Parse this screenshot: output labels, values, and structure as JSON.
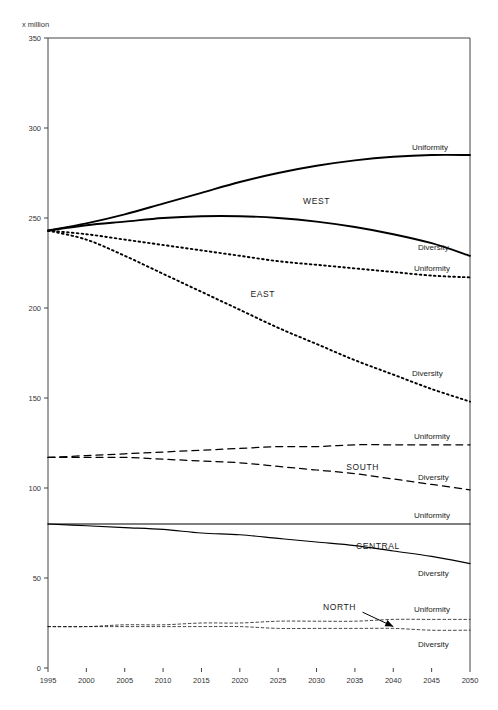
{
  "chart_data": {
    "type": "line",
    "title": "",
    "ylabel": "x million",
    "xlabel": "",
    "xlim": [
      1995,
      2050
    ],
    "ylim": [
      0,
      350
    ],
    "xticks": [
      1995,
      2000,
      2005,
      2010,
      2015,
      2020,
      2025,
      2030,
      2035,
      2040,
      2045,
      2050
    ],
    "yticks": [
      0,
      50,
      100,
      150,
      200,
      250,
      300,
      350
    ],
    "grid": false,
    "legend_position": "inline-end-of-line",
    "x": [
      1995,
      2000,
      2005,
      2010,
      2015,
      2020,
      2025,
      2030,
      2035,
      2040,
      2045,
      2050
    ],
    "series": [
      {
        "name": "WEST Uniformity",
        "region": "WEST",
        "scenario": "Uniformity",
        "style": "solid-thick",
        "values": [
          243,
          247,
          252,
          258,
          264,
          270,
          275,
          279,
          282,
          284,
          285,
          285
        ]
      },
      {
        "name": "WEST Diversity",
        "region": "WEST",
        "scenario": "Diversity",
        "style": "solid-thick",
        "values": [
          243,
          246,
          248,
          250,
          251,
          251,
          250,
          248,
          245,
          241,
          236,
          229
        ]
      },
      {
        "name": "EAST Uniformity",
        "region": "EAST",
        "scenario": "Uniformity",
        "style": "dotted",
        "values": [
          243,
          241,
          238,
          235,
          232,
          229,
          226,
          224,
          222,
          220,
          218,
          217
        ]
      },
      {
        "name": "EAST Diversity",
        "region": "EAST",
        "scenario": "Diversity",
        "style": "dotted",
        "values": [
          243,
          238,
          229,
          219,
          209,
          199,
          189,
          180,
          171,
          163,
          155,
          148
        ]
      },
      {
        "name": "SOUTH Uniformity",
        "region": "SOUTH",
        "scenario": "Uniformity",
        "style": "dashed",
        "values": [
          117,
          118,
          119,
          120,
          121,
          122,
          123,
          123,
          124,
          124,
          124,
          124
        ]
      },
      {
        "name": "SOUTH Diversity",
        "region": "SOUTH",
        "scenario": "Diversity",
        "style": "dashed",
        "values": [
          117,
          117,
          117,
          116,
          115,
          114,
          112,
          110,
          108,
          105,
          102,
          99
        ]
      },
      {
        "name": "CENTRAL Uniformity",
        "region": "CENTRAL",
        "scenario": "Uniformity",
        "style": "solid-thin",
        "values": [
          80,
          80,
          80,
          80,
          80,
          80,
          80,
          80,
          80,
          80,
          80,
          80
        ]
      },
      {
        "name": "CENTRAL Diversity",
        "region": "CENTRAL",
        "scenario": "Diversity",
        "style": "solid-thin",
        "values": [
          80,
          79,
          78,
          77,
          75,
          74,
          72,
          70,
          68,
          65,
          62,
          58
        ]
      },
      {
        "name": "NORTH Uniformity",
        "region": "NORTH",
        "scenario": "Uniformity",
        "style": "dotted-fine",
        "values": [
          23,
          23,
          24,
          24,
          25,
          25,
          26,
          26,
          26,
          27,
          27,
          27
        ]
      },
      {
        "name": "NORTH Diversity",
        "region": "NORTH",
        "scenario": "Diversity",
        "style": "dotted-fine",
        "values": [
          23,
          23,
          23,
          23,
          23,
          23,
          22,
          22,
          22,
          22,
          21,
          21
        ]
      }
    ],
    "region_labels": [
      {
        "text": "WEST",
        "x": 2030,
        "y": 258
      },
      {
        "text": "EAST",
        "x": 2023,
        "y": 206
      },
      {
        "text": "SOUTH",
        "x": 2036,
        "y": 110
      },
      {
        "text": "CENTRAL",
        "x": 2038,
        "y": 66
      },
      {
        "text": "NORTH",
        "x": 2033,
        "y": 32
      }
    ],
    "annotations": [
      {
        "text": "NORTH",
        "type": "arrow",
        "from_x": 2036,
        "from_y": 31,
        "to_x": 2040,
        "to_y": 23
      }
    ]
  },
  "axis": {
    "y_title": "x million",
    "y_labels": [
      "350",
      "300",
      "250",
      "200",
      "150",
      "100",
      "50",
      "0"
    ],
    "x_labels": [
      "1995",
      "2000",
      "2005",
      "2010",
      "2015",
      "2020",
      "2025",
      "2030",
      "2035",
      "2040",
      "2045",
      "2050"
    ]
  },
  "labels": {
    "west_uniformity": "Uniformity",
    "west_diversity": "Diversity",
    "east_uniformity": "Uniformity",
    "east_diversity": "Diversity",
    "south_uniformity": "Uniformity",
    "south_diversity": "Diversity",
    "central_uniformity": "Uniformity",
    "central_diversity": "Diversity",
    "north_uniformity": "Uniformity",
    "north_diversity": "Diversity",
    "region_west": "WEST",
    "region_east": "EAST",
    "region_south": "SOUTH",
    "region_central": "CENTRAL",
    "region_north": "NORTH"
  },
  "colors": {
    "line": "#000000",
    "axis": "#444444",
    "background": "#ffffff"
  }
}
